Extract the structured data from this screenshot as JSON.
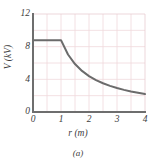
{
  "chart_data": {
    "type": "line",
    "title": "",
    "subtitle": "",
    "caption": "(a)",
    "xlabel": "r (m)",
    "ylabel": "V (kV)",
    "xlim": [
      0,
      4
    ],
    "ylim": [
      0,
      12
    ],
    "xticks": [
      "0",
      "1",
      "2",
      "3",
      "4"
    ],
    "xtick_values": [
      0,
      1,
      2,
      3,
      4
    ],
    "yticks": [
      "0",
      "4",
      "8",
      "12"
    ],
    "ytick_values": [
      0,
      4,
      8,
      12
    ],
    "grid": true,
    "grid_x_step": 0.5,
    "grid_y_step": 2,
    "legend": "none",
    "series": [
      {
        "name": "V(r)",
        "description": "constant inside r = 1 m, then falls off as 1/r",
        "x": [
          0,
          0.25,
          0.5,
          0.75,
          1.0,
          1.25,
          1.5,
          1.75,
          2.0,
          2.25,
          2.5,
          2.75,
          3.0,
          3.25,
          3.5,
          3.75,
          4.0
        ],
        "y": [
          8.8,
          8.8,
          8.8,
          8.8,
          8.8,
          7.04,
          5.87,
          5.03,
          4.4,
          3.91,
          3.52,
          3.2,
          2.93,
          2.71,
          2.51,
          2.35,
          2.2
        ],
        "color": "#6b6b6b"
      }
    ],
    "colors": {
      "curve": "#6b6b6b",
      "axis": "#6e6e6e",
      "grid": "#f0d8dc",
      "text": "#3d3d3d",
      "background": "#ffffff"
    }
  }
}
